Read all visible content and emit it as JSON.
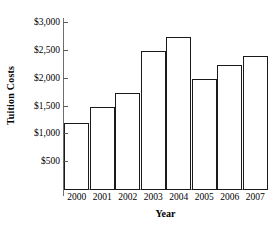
{
  "chart_data": {
    "type": "bar",
    "title": "",
    "xlabel": "Year",
    "ylabel": "Tuition Costs",
    "categories": [
      "2000",
      "2001",
      "2002",
      "2003",
      "2004",
      "2005",
      "2006",
      "2007"
    ],
    "values": [
      1200,
      1500,
      1750,
      2500,
      2750,
      2000,
      2250,
      2400
    ],
    "ylim": [
      0,
      3000
    ],
    "ytick_values": [
      500,
      1000,
      1500,
      2000,
      2500,
      3000
    ],
    "ytick_labels": [
      "$500",
      "$1,000",
      "$1,500",
      "$2,000",
      "$2,500",
      "$3,000"
    ],
    "grid": false,
    "legend": false,
    "bar_fill_color": "#ffffff",
    "bar_edge_color": "#1a1a1a",
    "axis_color": "#6e6e6e",
    "background_color": "#ffffff"
  }
}
